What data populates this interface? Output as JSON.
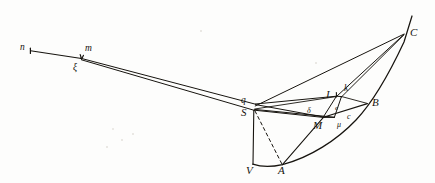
{
  "figure": {
    "background_color": "#fdfdfc",
    "ink_color": "#17140f",
    "width": 435,
    "height": 183
  },
  "labels": [
    {
      "name": "label-n",
      "text": "n",
      "x": 20,
      "y": 43,
      "size": "mid"
    },
    {
      "name": "label-m",
      "text": "m",
      "x": 85,
      "y": 44,
      "size": "mid"
    },
    {
      "name": "label-xi",
      "text": "ξ",
      "x": 73,
      "y": 64,
      "size": "mid"
    },
    {
      "name": "label-C",
      "text": "C",
      "x": 410,
      "y": 27,
      "size": "big"
    },
    {
      "name": "label-I",
      "text": "I",
      "x": 326,
      "y": 90,
      "size": "big"
    },
    {
      "name": "label-k",
      "text": "k",
      "x": 344,
      "y": 85,
      "size": "mid"
    },
    {
      "name": "label-B",
      "text": "B",
      "x": 372,
      "y": 98,
      "size": "big"
    },
    {
      "name": "label-q",
      "text": "q",
      "x": 241,
      "y": 97,
      "size": "mid"
    },
    {
      "name": "label-S",
      "text": "S",
      "x": 241,
      "y": 108,
      "size": "big"
    },
    {
      "name": "label-delta",
      "text": "δ",
      "x": 307,
      "y": 108,
      "size": "sml"
    },
    {
      "name": "label-e",
      "text": "e",
      "x": 335,
      "y": 106,
      "size": "tiny"
    },
    {
      "name": "label-c",
      "text": "c",
      "x": 347,
      "y": 114,
      "size": "sml"
    },
    {
      "name": "label-M",
      "text": "M",
      "x": 314,
      "y": 121,
      "size": "big"
    },
    {
      "name": "label-mu",
      "text": "μ",
      "x": 337,
      "y": 122,
      "size": "sml"
    },
    {
      "name": "label-V",
      "text": "V",
      "x": 246,
      "y": 166,
      "size": "big"
    },
    {
      "name": "label-A",
      "text": "A",
      "x": 278,
      "y": 166,
      "size": "big"
    }
  ],
  "points": {
    "n": [
      30,
      51
    ],
    "m": [
      81,
      58
    ],
    "xi": [
      81,
      59
    ],
    "q": [
      255,
      104
    ],
    "S": [
      254,
      110
    ],
    "V": [
      253,
      164
    ],
    "A": [
      282,
      165
    ],
    "I": [
      336,
      96
    ],
    "k": [
      341,
      97
    ],
    "M": [
      323,
      117
    ],
    "mu": [
      334,
      117
    ],
    "B": [
      367,
      104
    ],
    "C": [
      404,
      34
    ],
    "delta": [
      315,
      112
    ],
    "c": [
      352,
      110
    ]
  },
  "strokes": {
    "straight_lines": [
      {
        "name": "line-n-to-xi",
        "from": "n",
        "to": "xi"
      },
      {
        "name": "line-xi-to-q-upper",
        "from": "xi",
        "to": "q"
      },
      {
        "name": "line-xi-to-S-lower",
        "from": "xi",
        "to": "S"
      },
      {
        "name": "line-q-to-I",
        "from": "q",
        "to": "I"
      },
      {
        "name": "line-q-to-M",
        "from": "q",
        "to": "M"
      },
      {
        "name": "line-S-to-M",
        "from": "S",
        "to": "M"
      },
      {
        "name": "line-S-to-mu",
        "from": "S",
        "to": "mu"
      },
      {
        "name": "line-I-to-M",
        "from": "I",
        "to": "M"
      },
      {
        "name": "line-I-to-k",
        "from": "I",
        "to": "k"
      },
      {
        "name": "line-k-to-mu",
        "from": "k",
        "to": "mu"
      },
      {
        "name": "line-M-to-mu",
        "from": "M",
        "to": "mu"
      },
      {
        "name": "line-M-to-B",
        "from": "M",
        "to": "B"
      },
      {
        "name": "line-S-to-V",
        "from": "S",
        "to": "V"
      },
      {
        "name": "line-C-to-S",
        "from": "C",
        "to": "S"
      },
      {
        "name": "line-C-to-I",
        "from": "C",
        "to": "I"
      },
      {
        "name": "line-C-to-k",
        "from": "C",
        "to": "k"
      },
      {
        "name": "line-C-to-A",
        "from": "C",
        "to": "A"
      },
      {
        "name": "line-A-to-M",
        "from": "A",
        "to": "M"
      }
    ],
    "dashed_lines": [
      {
        "name": "dashed-line-S-to-A",
        "from": "S",
        "to": "A"
      }
    ],
    "curves": [
      {
        "name": "curve-V-A-B-C-parabola",
        "through": [
          "V",
          "A",
          "B",
          "C"
        ]
      }
    ],
    "tick_marks": [
      {
        "name": "tick-at-n",
        "at": "n"
      },
      {
        "name": "tick-at-xi",
        "at": "xi"
      }
    ]
  }
}
